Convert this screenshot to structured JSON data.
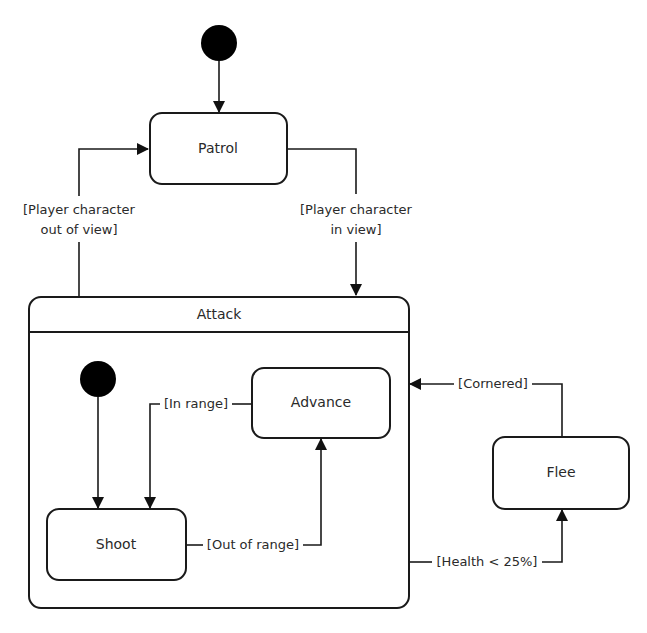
{
  "diagram": {
    "type": "uml-state-machine",
    "states": {
      "patrol": {
        "label": "Patrol"
      },
      "attack": {
        "label": "Attack",
        "composite": true
      },
      "advance": {
        "label": "Advance"
      },
      "shoot": {
        "label": "Shoot"
      },
      "flee": {
        "label": "Flee"
      }
    },
    "initial_states": [
      {
        "target": "Patrol",
        "scope": "top-level"
      },
      {
        "target": "Shoot",
        "scope": "Attack"
      }
    ],
    "transitions": {
      "out_of_view": {
        "from": "Attack",
        "to": "Patrol",
        "guard_line1": "[Player character",
        "guard_line2": "out of view]"
      },
      "in_view": {
        "from": "Patrol",
        "to": "Attack",
        "guard_line1": "[Player character",
        "guard_line2": "in view]"
      },
      "in_range": {
        "from": "Advance",
        "to": "Shoot",
        "guard": "[In range]"
      },
      "out_of_range": {
        "from": "Shoot",
        "to": "Advance",
        "guard": "[Out of range]"
      },
      "cornered": {
        "from": "Flee",
        "to": "Attack",
        "guard": "[Cornered]"
      },
      "health_low": {
        "from": "Attack",
        "to": "Flee",
        "guard": "[Health < 25%]"
      }
    },
    "colors": {
      "stroke": "#1a1a1a",
      "text": "#2a2a2a",
      "background": "#ffffff"
    }
  }
}
